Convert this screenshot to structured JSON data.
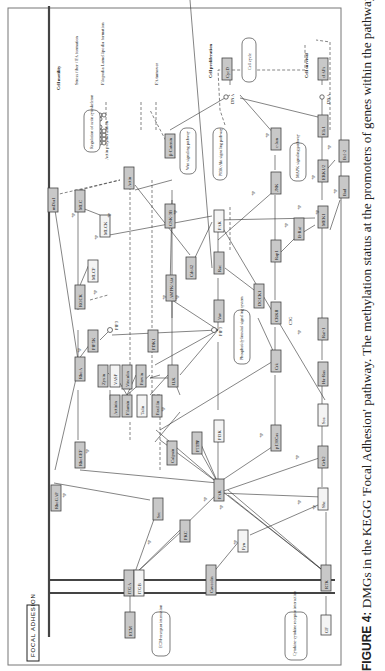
{
  "figure": {
    "title": "FOCAL ADHESION",
    "caption_label": "FIGURE 4:",
    "caption_text": " DMGs in the KEGG 'Focal Adhesion' pathway. The methylation status at the promoters of genes within the pathway is shown."
  },
  "nodes": {
    "ecm": "ECM",
    "itga": "ITGA",
    "itgb": "ITGB",
    "caveolin": "Caveolin",
    "rtk": "RTK",
    "gf": "GF",
    "fyn": "Fyn",
    "pkc": "PKC",
    "src": "Src",
    "fak": "FAK",
    "shc": "Shc",
    "grb2": "Grb2",
    "sos": "Sos",
    "harasras": "Ha-Ras",
    "raf1": "Raf-1",
    "rhogap": "RhoGAP",
    "rhogef": "RhoGEF",
    "rhoa": "RhoA",
    "rock": "ROCK",
    "mlcp": "MLCP",
    "mlc": "MLC",
    "mlck": "MLCK",
    "mdia1": "mDia1",
    "pip5k": "PIP5K",
    "calpain": "Calpain",
    "actinin": "Actinin",
    "filamin": "Filamin",
    "talin": "Talin",
    "paxillin": "Paxillin",
    "zyxin": "Zyxin",
    "vasp": "VASP",
    "vinculin": "Vinculin",
    "parvin": "Parvin",
    "ilk": "ILK",
    "pdk1": "PDK1",
    "akt": "AMPK/Akt",
    "gsk3b": "GSK-3B",
    "bcatenin": "β-Catenin",
    "actin": "Actin",
    "pten": "PTEN",
    "pi3k": "PI3K",
    "vav": "Vav",
    "rac": "Rac",
    "pak": "PAK",
    "cdc42": "Cdc42",
    "dock1": "DOCK1",
    "crk": "Crk",
    "p130cas": "p130Cas",
    "crkii": "CRKII",
    "c3g": "C3G",
    "rap1": "Rap1",
    "braf": "B-Raf",
    "jnk": "JNK",
    "cjun": "c-Jun",
    "mek1": "MEK1",
    "erk12": "ERK1/2",
    "elk1": "Elk1",
    "bad": "Bad",
    "bcl2": "Bcl-2",
    "cycd": "CycD",
    "ciaps": "cIAPs"
  },
  "annotations": {
    "ecm_receptor": "ECM-receptor interaction",
    "cytokine": "Cytokine-cytokine receptor interaction",
    "phosphatidyl": "Phosphatidylinositol signaling system",
    "pi3k_akt": "PI3K-Akt signaling pathway",
    "wnt": "Wnt signaling pathway",
    "mapk": "MAPK signaling pathway",
    "cell_cycle": "Cell cycle",
    "reg_actin": "Regulation of actin cytoskeleton",
    "actin_poly": "Actin polymerization",
    "pip3": "PIP3",
    "pip3b": "PIP3",
    "dna1": "DNA",
    "dna2": "DNA",
    "p": "+p",
    "cell_motility": "Cell motility",
    "stress_fiber": "Stress fiber / FA formation",
    "filopodia": "Filopodia Lamellipodia formation",
    "fa_turnover": "FA turnover",
    "cell_prolif": "Cell proliferation",
    "cell_survival": "Cell survival"
  },
  "colors": {
    "methylated_fill": "#c8c8c8",
    "unmethylated_fill": "#f4f4f4",
    "line": "#333333"
  }
}
